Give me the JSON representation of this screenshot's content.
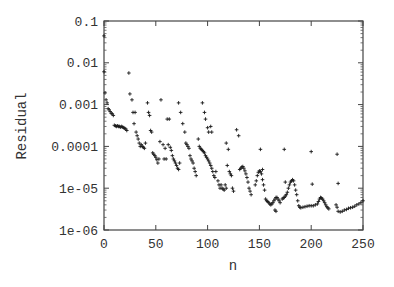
{
  "chart_data": {
    "type": "scatter",
    "title": "",
    "xlabel": "n",
    "ylabel": "Residual",
    "xlim": [
      0,
      250
    ],
    "ylim": [
      1e-06,
      0.1
    ],
    "yscale": "log",
    "grid": false,
    "legend": null,
    "marker": "+",
    "marker_color": "#1a1a1a",
    "x_ticks": [
      0,
      50,
      100,
      150,
      200,
      250
    ],
    "x_tick_labels": [
      "0",
      "50",
      "100",
      "150",
      "200",
      "250"
    ],
    "y_ticks": [
      1e-06,
      1e-05,
      0.0001,
      0.001,
      0.01,
      0.1
    ],
    "y_tick_labels": [
      "1e-06",
      "1e-05",
      "0.0001",
      "0.001",
      "0.01",
      "0.1"
    ],
    "series": [
      {
        "name": "Residual",
        "points": [
          [
            0,
            0.044
          ],
          [
            0,
            0.0061
          ],
          [
            1,
            0.0019
          ],
          [
            2,
            0.0013
          ],
          [
            3,
            0.0011
          ],
          [
            4,
            0.0008
          ],
          [
            5,
            0.00075
          ],
          [
            6,
            0.00068
          ],
          [
            7,
            0.00062
          ],
          [
            8,
            0.0006
          ],
          [
            9,
            0.00055
          ],
          [
            10,
            0.00032
          ],
          [
            11,
            0.00031
          ],
          [
            12,
            0.0003
          ],
          [
            13,
            0.00031
          ],
          [
            14,
            0.0003
          ],
          [
            15,
            0.0003
          ],
          [
            16,
            0.00029
          ],
          [
            17,
            0.0003
          ],
          [
            18,
            0.00029
          ],
          [
            19,
            0.00028
          ],
          [
            20,
            0.00027
          ],
          [
            21,
            0.00026
          ],
          [
            22,
            0.00024
          ],
          [
            24,
            0.0057
          ],
          [
            25,
            0.0018
          ],
          [
            27,
            0.0013
          ],
          [
            28,
            0.00065
          ],
          [
            30,
            0.00065
          ],
          [
            29,
            0.00035
          ],
          [
            31,
            0.00022
          ],
          [
            32,
            0.00018
          ],
          [
            33,
            0.00015
          ],
          [
            34,
            0.00012
          ],
          [
            35,
            0.0001
          ],
          [
            36,
            0.00011
          ],
          [
            37,
            0.0001
          ],
          [
            38,
            9.5e-05
          ],
          [
            39,
            9e-05
          ],
          [
            40,
            0.00012
          ],
          [
            42,
            0.0011
          ],
          [
            43,
            0.00065
          ],
          [
            44,
            0.00055
          ],
          [
            45,
            0.00024
          ],
          [
            46,
            0.00022
          ],
          [
            47,
            7e-05
          ],
          [
            48,
            6.5e-05
          ],
          [
            49,
            6e-05
          ],
          [
            50,
            5.5e-05
          ],
          [
            51,
            4.8e-05
          ],
          [
            52,
            4e-05
          ],
          [
            53,
            5e-05
          ],
          [
            54,
            0.00013
          ],
          [
            55,
            0.0013
          ],
          [
            57,
            0.00011
          ],
          [
            58,
            5e-05
          ],
          [
            59,
            9e-05
          ],
          [
            60,
            5e-05
          ],
          [
            61,
            0.00045
          ],
          [
            63,
            0.00045
          ],
          [
            62,
            0.00011
          ],
          [
            64,
            9.5e-05
          ],
          [
            65,
            8e-05
          ],
          [
            66,
            6e-05
          ],
          [
            67,
            5e-05
          ],
          [
            68,
            4.5e-05
          ],
          [
            69,
            4e-05
          ],
          [
            70,
            3.5e-05
          ],
          [
            71,
            3e-05
          ],
          [
            72,
            2.8e-05
          ],
          [
            73,
            4e-05
          ],
          [
            72,
            0.0011
          ],
          [
            74,
            0.00065
          ],
          [
            76,
            0.00035
          ],
          [
            78,
            0.00022
          ],
          [
            79,
            0.00012
          ],
          [
            80,
            0.00011
          ],
          [
            81,
            0.0001
          ],
          [
            82,
            9e-05
          ],
          [
            83,
            6e-05
          ],
          [
            84,
            5e-05
          ],
          [
            85,
            4.5e-05
          ],
          [
            86,
            4e-05
          ],
          [
            87,
            3e-05
          ],
          [
            88,
            2.5e-05
          ],
          [
            89,
            2e-05
          ],
          [
            91,
            0.00015
          ],
          [
            92,
            0.0001
          ],
          [
            93,
            9e-05
          ],
          [
            94,
            8.5e-05
          ],
          [
            95,
            8e-05
          ],
          [
            96,
            7.5e-05
          ],
          [
            97,
            7e-05
          ],
          [
            98,
            6e-05
          ],
          [
            99,
            5.5e-05
          ],
          [
            100,
            5e-05
          ],
          [
            101,
            4.5e-05
          ],
          [
            95,
            0.0011
          ],
          [
            97,
            0.00065
          ],
          [
            98,
            0.00045
          ],
          [
            100,
            0.00028
          ],
          [
            101,
            0.00022
          ],
          [
            103,
            0.0003
          ],
          [
            104,
            0.00022
          ],
          [
            102,
            4e-05
          ],
          [
            103,
            3.5e-05
          ],
          [
            104,
            3e-05
          ],
          [
            105,
            2.5e-05
          ],
          [
            106,
            2e-05
          ],
          [
            107,
            1.8e-05
          ],
          [
            108,
            2.5e-05
          ],
          [
            110,
            1.5e-05
          ],
          [
            111,
            1.2e-05
          ],
          [
            112,
            1e-05
          ],
          [
            113,
            1.2e-05
          ],
          [
            114,
            1e-05
          ],
          [
            115,
            9.5e-06
          ],
          [
            116,
            9e-06
          ],
          [
            117,
            1.2e-05
          ],
          [
            118,
            1e-05
          ],
          [
            118,
            0.00012
          ],
          [
            120,
            8.5e-05
          ],
          [
            119,
            3.5e-05
          ],
          [
            121,
            2.5e-05
          ],
          [
            122,
            2.2e-05
          ],
          [
            123,
            2e-05
          ],
          [
            124,
            1e-05
          ],
          [
            125,
            8.5e-06
          ],
          [
            128,
            0.00025
          ],
          [
            130,
            0.00018
          ],
          [
            131,
            2.8e-05
          ],
          [
            132,
            3e-05
          ],
          [
            133,
            3.2e-05
          ],
          [
            134,
            3.3e-05
          ],
          [
            135,
            3e-05
          ],
          [
            136,
            2.6e-05
          ],
          [
            137,
            2.2e-05
          ],
          [
            138,
            1.8e-05
          ],
          [
            139,
            1.4e-05
          ],
          [
            140,
            1e-05
          ],
          [
            141,
            8.5e-06
          ],
          [
            142,
            7e-06
          ],
          [
            146,
            1.2e-05
          ],
          [
            147,
            1.5e-05
          ],
          [
            148,
            2e-05
          ],
          [
            149,
            2.4e-05
          ],
          [
            150,
            2.6e-05
          ],
          [
            151,
            2.5e-05
          ],
          [
            152,
            2.2e-05
          ],
          [
            153,
            1.6e-05
          ],
          [
            154,
            1.2e-05
          ],
          [
            155,
            9e-06
          ],
          [
            151,
            8.5e-05
          ],
          [
            153,
            2.8e-05
          ],
          [
            156,
            5.5e-06
          ],
          [
            157,
            5e-06
          ],
          [
            158,
            4.8e-06
          ],
          [
            159,
            4.5e-06
          ],
          [
            160,
            4.2e-06
          ],
          [
            161,
            4e-06
          ],
          [
            162,
            4.2e-06
          ],
          [
            163,
            4.5e-06
          ],
          [
            164,
            5e-06
          ],
          [
            165,
            5.5e-06
          ],
          [
            166,
            6e-06
          ],
          [
            167,
            6e-06
          ],
          [
            168,
            5.5e-06
          ],
          [
            169,
            5e-06
          ],
          [
            170,
            4.5e-06
          ],
          [
            165,
            3e-06
          ],
          [
            166,
            2.8e-06
          ],
          [
            174,
            8.5e-05
          ],
          [
            175,
            1.4e-05
          ],
          [
            172,
            5.5e-06
          ],
          [
            173,
            5.8e-06
          ],
          [
            174,
            6e-06
          ],
          [
            175,
            6.5e-06
          ],
          [
            176,
            7e-06
          ],
          [
            177,
            8e-06
          ],
          [
            178,
            1e-05
          ],
          [
            179,
            1.2e-05
          ],
          [
            180,
            1.4e-05
          ],
          [
            181,
            1.5e-05
          ],
          [
            182,
            1.6e-05
          ],
          [
            183,
            1.5e-05
          ],
          [
            184,
            1.2e-05
          ],
          [
            185,
            9e-06
          ],
          [
            186,
            7e-06
          ],
          [
            187,
            5e-06
          ],
          [
            188,
            3.8e-06
          ],
          [
            189,
            3.5e-06
          ],
          [
            190,
            3.4e-06
          ],
          [
            192,
            3.5e-06
          ],
          [
            194,
            3.6e-06
          ],
          [
            196,
            3.7e-06
          ],
          [
            198,
            3.8e-06
          ],
          [
            200,
            3.8e-06
          ],
          [
            202,
            3.8e-06
          ],
          [
            204,
            4e-06
          ],
          [
            206,
            4.2e-06
          ],
          [
            207,
            4.8e-06
          ],
          [
            208,
            5.5e-06
          ],
          [
            209,
            6e-06
          ],
          [
            210,
            5.8e-06
          ],
          [
            211,
            5.5e-06
          ],
          [
            212,
            5e-06
          ],
          [
            213,
            4.5e-06
          ],
          [
            214,
            4e-06
          ],
          [
            215,
            3.6e-06
          ],
          [
            216,
            3.4e-06
          ],
          [
            217,
            3.2e-06
          ],
          [
            200,
            7.5e-05
          ],
          [
            201,
            1.25e-05
          ],
          [
            225,
            6.5e-05
          ],
          [
            226,
            1.3e-05
          ],
          [
            224,
            4e-06
          ],
          [
            225,
            3.5e-06
          ],
          [
            226,
            2.8e-06
          ],
          [
            228,
            2.7e-06
          ],
          [
            230,
            2.8e-06
          ],
          [
            232,
            3e-06
          ],
          [
            234,
            3.1e-06
          ],
          [
            236,
            3.3e-06
          ],
          [
            238,
            3.4e-06
          ],
          [
            240,
            3.5e-06
          ],
          [
            242,
            3.7e-06
          ],
          [
            244,
            4e-06
          ],
          [
            246,
            4.2e-06
          ],
          [
            248,
            4.5e-06
          ],
          [
            250,
            5e-06
          ]
        ]
      }
    ]
  }
}
